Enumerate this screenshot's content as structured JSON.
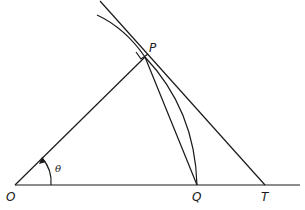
{
  "diagram": {
    "points": {
      "O": {
        "label": "O",
        "x": 15,
        "y": 185
      },
      "P": {
        "label": "P",
        "x": 145,
        "y": 57
      },
      "Q": {
        "label": "Q",
        "x": 197,
        "y": 185
      },
      "T": {
        "label": "T",
        "x": 265,
        "y": 185
      }
    },
    "angle_label": "θ",
    "elements": [
      "baseline OT",
      "radius OP",
      "tangent line through P to T",
      "chord PQ",
      "arc PQ",
      "curve through P",
      "right angle mark at P"
    ],
    "colors": {
      "stroke": "#1a1a1a",
      "background": "#ffffff"
    }
  }
}
